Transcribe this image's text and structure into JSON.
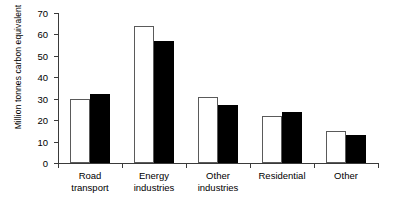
{
  "chart_data": {
    "type": "bar",
    "title": "",
    "xlabel": "",
    "ylabel": "Million tonnes carbon equivalent",
    "ylim": [
      0,
      70
    ],
    "yticks": [
      0,
      10,
      20,
      30,
      40,
      50,
      60,
      70
    ],
    "grid": false,
    "legend": null,
    "categories": [
      "Road transport",
      "Energy industries",
      "Other industries",
      "Residential",
      "Other"
    ],
    "category_lines": [
      [
        "Road",
        "transport"
      ],
      [
        "Energy",
        "industries"
      ],
      [
        "Other",
        "industries"
      ],
      [
        "Residential"
      ],
      [
        "Other"
      ]
    ],
    "series": [
      {
        "name": "open",
        "style": "white-outline",
        "color": "#ffffff",
        "values": [
          30,
          64,
          31,
          22,
          15
        ]
      },
      {
        "name": "filled",
        "style": "solid-black",
        "color": "#000000",
        "values": [
          32,
          57,
          27,
          24,
          13
        ]
      }
    ]
  }
}
